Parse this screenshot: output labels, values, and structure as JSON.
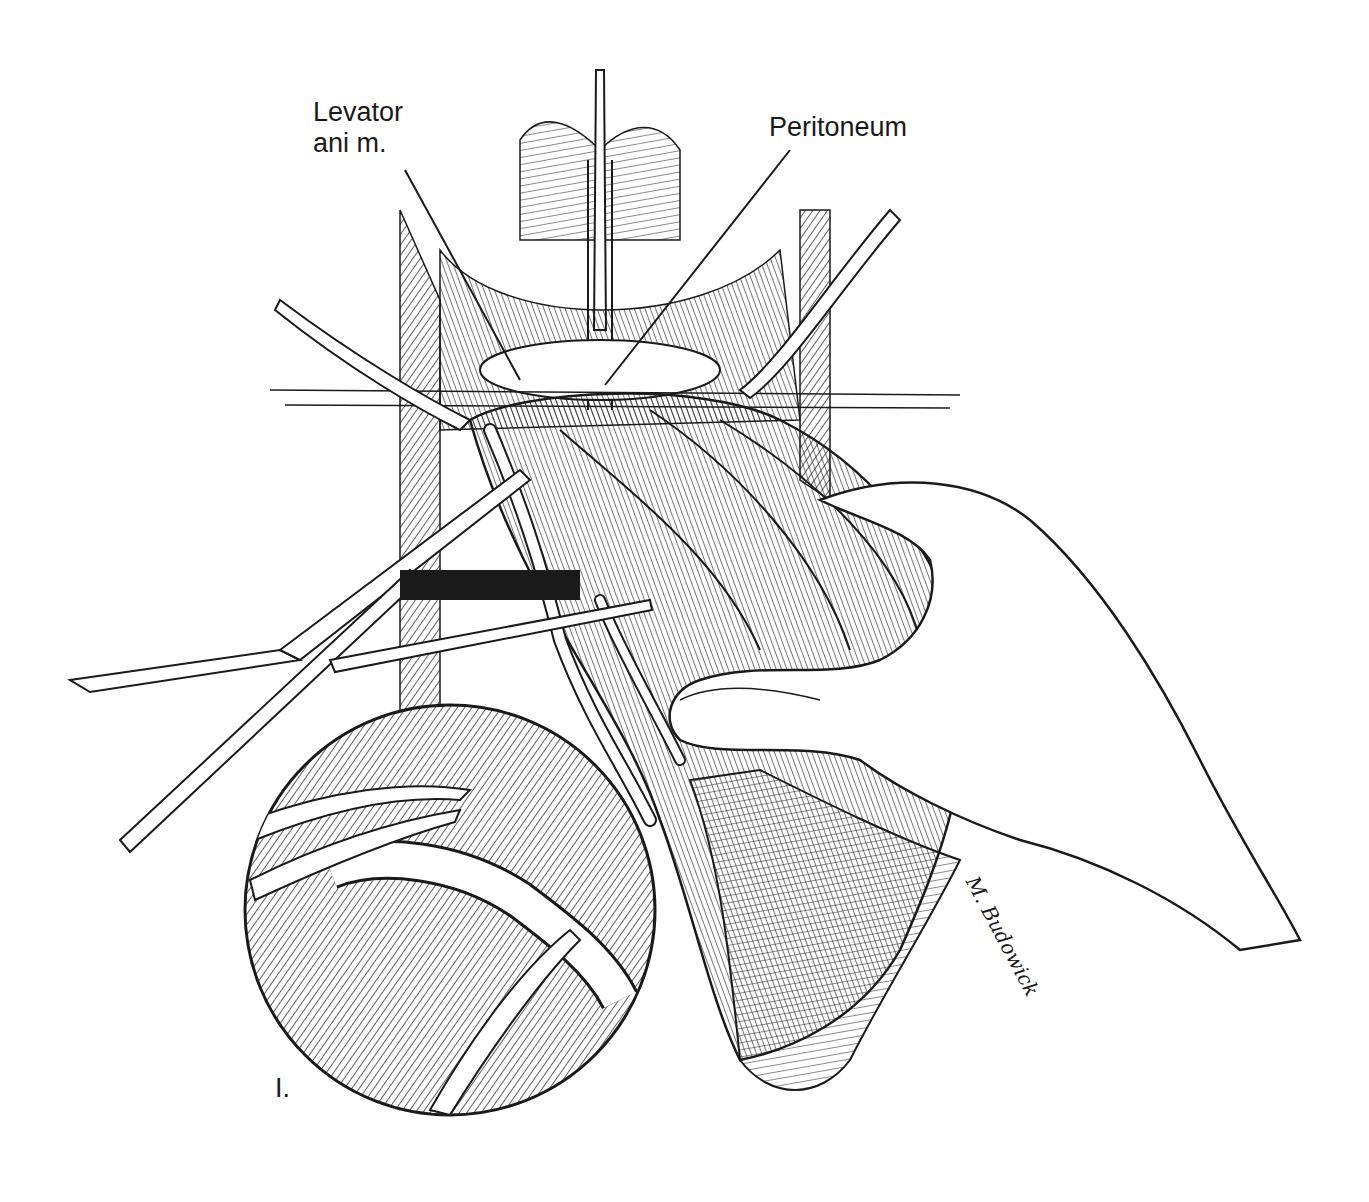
{
  "figure": {
    "panel_label": "I.",
    "labels": [
      {
        "id": "levator",
        "text": "Levator\nani m."
      },
      {
        "id": "peritoneum",
        "text": "Peritoneum"
      }
    ],
    "signature": "M. Budowick",
    "colors": {
      "ink": "#1a1a1a",
      "paper": "#ffffff"
    }
  }
}
